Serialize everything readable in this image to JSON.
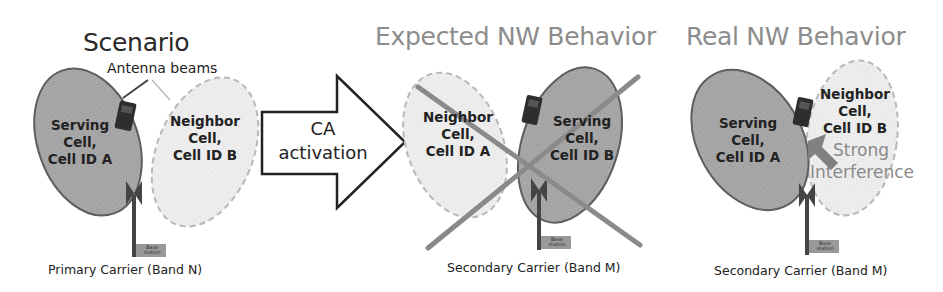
{
  "panels": [
    {
      "id": "scenario",
      "title": "Scenario",
      "annotation": "Antenna beams",
      "serving_cell": {
        "line1": "Serving",
        "line2": "Cell,",
        "line3": "Cell ID A"
      },
      "neighbor_cell": {
        "line1": "Neighbor",
        "line2": "Cell,",
        "line3": "Cell ID B"
      },
      "base_station_label": "Base station",
      "caption": "Primary Carrier (Band N)"
    },
    {
      "id": "expected",
      "title": "Expected NW Behavior",
      "neighbor_cell": {
        "line1": "Neighbor",
        "line2": "Cell,",
        "line3": "Cell ID A"
      },
      "serving_cell": {
        "line1": "Serving",
        "line2": "Cell,",
        "line3": "Cell ID B"
      },
      "base_station_label": "Base station",
      "caption": "Secondary Carrier (Band M)",
      "crossed_out": true
    },
    {
      "id": "real",
      "title": "Real NW Behavior",
      "serving_cell": {
        "line1": "Serving",
        "line2": "Cell,",
        "line3": "Cell ID A"
      },
      "neighbor_cell": {
        "line1": "Neighbor",
        "line2": "Cell,",
        "line3": "Cell ID B"
      },
      "interference": {
        "line1": "Strong",
        "line2": "Interference"
      },
      "base_station_label": "Base station",
      "caption": "Secondary Carrier (Band M)"
    }
  ],
  "transition_arrow": {
    "line1": "CA",
    "line2": "activation"
  },
  "colors": {
    "serving_fill": "#a6a6a6",
    "serving_stroke": "#5a5a5a",
    "neighbor_fill": "#ececec",
    "neighbor_stroke": "#b5b5b5",
    "cross": "#8a8a8a",
    "light_title": "#8c8c8c"
  }
}
